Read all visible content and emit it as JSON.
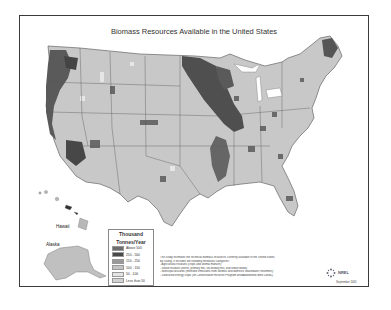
{
  "title": "Biomass Resources Available in the United States",
  "labels": {
    "hawaii": "Hawaii",
    "alaska": "Alaska"
  },
  "legend": {
    "title_line1": "Thousand",
    "title_line2": "Tonnes/Year",
    "items": [
      {
        "label": "Above 500",
        "color": "#6e6e6e"
      },
      {
        "label": "250 - 500",
        "color": "#4a4a4a"
      },
      {
        "label": "150 - 250",
        "color": "#9a9a9a"
      },
      {
        "label": "100 - 150",
        "color": "#c4c4c4"
      },
      {
        "label": "50 - 100",
        "color": "#e4e4e4"
      },
      {
        "label": "Less than 50",
        "color": "#d2d2d2"
      }
    ]
  },
  "description": {
    "line1": "This study estimates the technical biomass resources currently available in the United States",
    "line2": "by county. It includes the following feedstock categories:",
    "line3": "- Agricultural residues (crops and animal manure);",
    "line4": "- Wood residues (forest, primary mill, secondary mill, and urban wood);",
    "line5": "- Municipal discards (methane emissions from landfills and domestic wastewater treatment);",
    "line6": "- Dedicated energy crops (on Conservation Reserve Program and Abandoned Mine Lands)."
  },
  "footer": {
    "logo": "NREL",
    "date": "September 2005"
  },
  "colors": {
    "border": "#3a3a3a",
    "land": "#c8c8c8",
    "state_line": "#555555"
  }
}
